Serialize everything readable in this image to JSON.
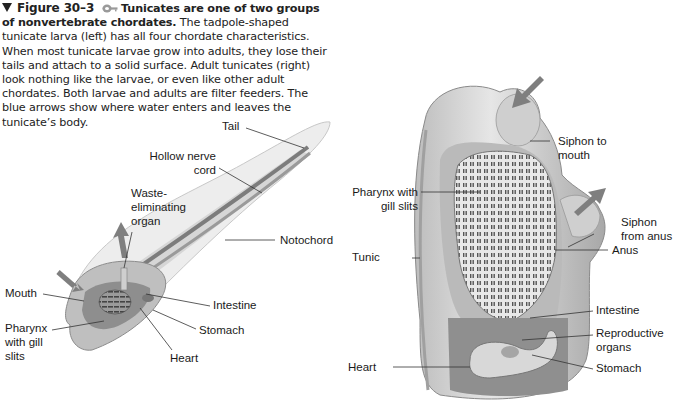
{
  "caption": {
    "figure_number": "Figure 30–3",
    "lead_bold": "Tunicates are one of two groups of nonvertebrate chordates.",
    "body": " The tadpole-shaped tunicate larva (left) has all four chordate characteristics. When most tunicate larvae grow into adults, they lose their tails and attach to a solid surface. Adult tunicates (right) look nothing like the larvae, or even like other adult chordates. Both larvae and adults are filter feeders. The blue arrows show where water enters and leaves the tunicate’s body.",
    "icons": [
      "triangle-marker-icon",
      "key-icon"
    ]
  },
  "larva": {
    "title": "Tunicate larva (left)",
    "labels": {
      "tail": "Tail",
      "hollow_nerve_cord": "Hollow nerve\ncord",
      "hollow_nerve_cord_l1": "Hollow nerve",
      "hollow_nerve_cord_l2": "cord",
      "waste_l1": "Waste-",
      "waste_l2": "eliminating",
      "waste_l3": "organ",
      "notochord": "Notochord",
      "mouth": "Mouth",
      "intestine": "Intestine",
      "pharynx_l1": "Pharynx",
      "pharynx_l2": "with gill",
      "pharynx_l3": "slits",
      "stomach": "Stomach",
      "heart": "Heart"
    }
  },
  "adult": {
    "title": "Adult tunicate (right)",
    "labels": {
      "siphon_mouth_l1": "Siphon to",
      "siphon_mouth_l2": "mouth",
      "pharynx_l1": "Pharynx with",
      "pharynx_l2": "gill slits",
      "siphon_anus_l1": "Siphon",
      "siphon_anus_l2": "from anus",
      "anus": "Anus",
      "tunic": "Tunic",
      "intestine": "Intestine",
      "repro_l1": "Reproductive",
      "repro_l2": "organs",
      "heart": "Heart",
      "stomach": "Stomach"
    }
  },
  "colors": {
    "text": "#1a1a1a",
    "body_fill": "#d9d9d9",
    "body_dark": "#8a8a8a",
    "arrow": "#7a7a7a",
    "leader": "#333333"
  }
}
